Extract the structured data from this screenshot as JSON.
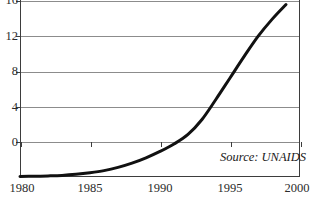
{
  "chart_data": {
    "type": "line",
    "title": "",
    "subtitle": "",
    "xlabel": "",
    "ylabel": "",
    "xlim": [
      1980,
      2000
    ],
    "ylim": [
      0,
      20
    ],
    "grid": true,
    "legend": "none",
    "x_ticks": [
      "1980",
      "1985",
      "1990",
      "1995",
      "2000"
    ],
    "x_tick_values": [
      1980,
      1985,
      1990,
      1995,
      2000
    ],
    "y_ticks": [
      "0",
      "4",
      "8",
      "12",
      "16",
      "20"
    ],
    "y_tick_values": [
      0,
      4,
      8,
      12,
      16,
      20
    ],
    "annotations": [
      {
        "text": "Source: UNAIDS",
        "position": "bottom-right",
        "style": "italic"
      }
    ],
    "series": [
      {
        "name": "",
        "color": "#111111",
        "line_width_px": 3,
        "x": [
          1980,
          1981,
          1982,
          1983,
          1984,
          1985,
          1986,
          1987,
          1988,
          1989,
          1990,
          1991,
          1992,
          1993,
          1994,
          1995,
          1996,
          1997,
          1998,
          1999
        ],
        "values": [
          0.05,
          0.07,
          0.1,
          0.15,
          0.25,
          0.4,
          0.6,
          0.9,
          1.3,
          1.8,
          2.4,
          3.1,
          4.0,
          5.4,
          7.3,
          9.3,
          11.3,
          13.2,
          14.8,
          16.2
        ]
      }
    ],
    "reference_crossings": [
      {
        "value": 4,
        "year": 1992.0
      },
      {
        "value": 8,
        "year": 1994.2
      },
      {
        "value": 12,
        "year": 1996.6
      },
      {
        "value": 16.2,
        "year": 1999.0
      }
    ]
  },
  "colors": {
    "curve": "#111111",
    "gridline": "#8c8c8c",
    "frame": "#3d3d3d",
    "tick_text": "#2b2b2b",
    "background": "#ffffff"
  },
  "source_note": "Source: UNAIDS"
}
